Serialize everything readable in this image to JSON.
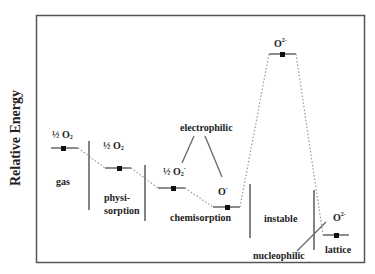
{
  "axis": {
    "ylabel": "Relative Energy"
  },
  "levels": [
    {
      "id": "gas",
      "species": "½ O",
      "sub": "2",
      "sup": "",
      "region": "gas"
    },
    {
      "id": "physisorption",
      "species": "½ O",
      "sub": "2",
      "sup": "",
      "region_line1": "physi-",
      "region_line2": "sorption"
    },
    {
      "id": "chemisorption-superoxide",
      "species": "½ O",
      "sub": "2",
      "sup": "-"
    },
    {
      "id": "chemisorption-oxide",
      "species": "O",
      "sub": "",
      "sup": "-",
      "region": "chemisorption"
    },
    {
      "id": "instable",
      "species": "O",
      "sub": "",
      "sup": "2-",
      "region": "instable"
    },
    {
      "id": "lattice",
      "species": "O",
      "sub": "",
      "sup": "2-",
      "region": "lattice"
    }
  ],
  "annotations": {
    "electrophilic": "electrophilic",
    "nucleophilic": "nucleophilic"
  },
  "colors": {
    "frame": "#555555",
    "line": "#777777",
    "dot": "#111111",
    "text": "#222222"
  }
}
